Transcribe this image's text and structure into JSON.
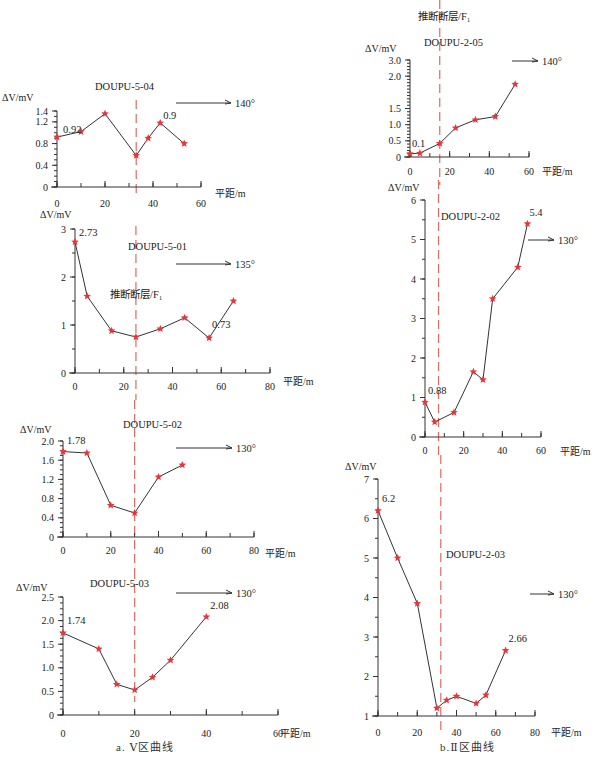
{
  "colors": {
    "axis": "#333333",
    "line": "#333333",
    "marker": "#e8343a",
    "fault": "#e06a5e"
  },
  "subcaptions": {
    "left": "a. Ⅴ区曲线",
    "right": "b.Ⅱ区曲线"
  },
  "chart_data": [
    {
      "id": "DOUPU-5-04",
      "type": "line",
      "title": "DOUPU-5-04",
      "xlabel": "平距/m",
      "ylabel": "ΔV/mV",
      "direction": "140°",
      "xlim": [
        0,
        60
      ],
      "ylim": [
        0,
        1.4
      ],
      "xticks": [
        0,
        20,
        40,
        60
      ],
      "yticks": [
        0,
        0.4,
        0.8,
        1.2,
        1.4
      ],
      "ytick_labels": [
        "0",
        "0.4",
        "0.8",
        "1.2",
        "1.4"
      ],
      "x": [
        0,
        10,
        20,
        33,
        38,
        43,
        53
      ],
      "values": [
        0.92,
        1.02,
        1.35,
        0.58,
        0.9,
        1.18,
        0.8
      ],
      "annotations": [
        {
          "text": "0.92",
          "x": 0,
          "y": 0.92
        },
        {
          "text": "0.9",
          "x": 43,
          "y": 1.18
        }
      ],
      "fault_x": 33
    },
    {
      "id": "DOUPU-5-01",
      "type": "line",
      "title": "DOUPU-5-01",
      "xlabel": "平距/m",
      "ylabel": "ΔV/mV",
      "direction": "135°",
      "fault_label": "推断断层/F₁",
      "xlim": [
        0,
        80
      ],
      "ylim": [
        0,
        3
      ],
      "xticks": [
        0,
        20,
        40,
        60,
        80
      ],
      "yticks": [
        0,
        1,
        2,
        3
      ],
      "ytick_labels": [
        "0",
        "1",
        "2",
        "3"
      ],
      "x": [
        0,
        5,
        15,
        25,
        35,
        45,
        55,
        65
      ],
      "values": [
        2.73,
        1.6,
        0.88,
        0.75,
        0.92,
        1.15,
        0.73,
        1.5
      ],
      "annotations": [
        {
          "text": "2.73",
          "x": 0,
          "y": 2.73
        },
        {
          "text": "0.73",
          "x": 55,
          "y": 0.73
        }
      ],
      "fault_x": 25
    },
    {
      "id": "DOUPU-5-02",
      "type": "line",
      "title": "DOUPU-5-02",
      "xlabel": "平距/m",
      "ylabel": "ΔV/mV",
      "direction": "130°",
      "xlim": [
        0,
        80
      ],
      "ylim": [
        0,
        2.0
      ],
      "xticks": [
        0,
        20,
        40,
        60,
        80
      ],
      "yticks": [
        0,
        0.4,
        0.8,
        1.2,
        1.6,
        2.0
      ],
      "ytick_labels": [
        "0",
        "0.4",
        "0.8",
        "1.2",
        "1.6",
        "2.0"
      ],
      "x": [
        0,
        10,
        20,
        30,
        40,
        50
      ],
      "values": [
        1.78,
        1.75,
        0.66,
        0.5,
        1.25,
        1.5
      ],
      "annotations": [
        {
          "text": "1.78",
          "x": 0,
          "y": 1.78
        }
      ],
      "fault_x": 30
    },
    {
      "id": "DOUPU-5-03",
      "type": "line",
      "title": "DOUPU-5-03",
      "xlabel": "平距/m",
      "ylabel": "ΔV/mV",
      "direction": "130°",
      "xlim": [
        0,
        60
      ],
      "ylim": [
        0,
        2.5
      ],
      "xticks": [
        0,
        20,
        40,
        60
      ],
      "yticks": [
        0,
        0.5,
        1.0,
        1.5,
        2.0,
        2.5
      ],
      "ytick_labels": [
        "0",
        "0.5",
        "1.0",
        "1.5",
        "2.0",
        "2.5"
      ],
      "x": [
        0,
        10,
        15,
        20,
        25,
        30,
        40
      ],
      "values": [
        1.74,
        1.4,
        0.65,
        0.53,
        0.8,
        1.16,
        2.08
      ],
      "annotations": [
        {
          "text": "1.74",
          "x": 0,
          "y": 1.74
        },
        {
          "text": "2.08",
          "x": 40,
          "y": 2.08
        }
      ],
      "fault_x": 20
    },
    {
      "id": "DOUPU-2-05",
      "type": "line",
      "title": "DOUPU-2-05",
      "xlabel": "平距/m",
      "ylabel": "ΔV/mV",
      "direction": "140°",
      "fault_label": "推断断层/F₁",
      "xlim": [
        0,
        60
      ],
      "ylim": [
        0,
        3.0
      ],
      "xticks": [
        0,
        20,
        40,
        60
      ],
      "yticks": [
        0,
        0.5,
        1.0,
        1.5,
        2.5,
        3.0
      ],
      "ytick_labels": [
        "0",
        "0.5",
        "1.0",
        "1.5",
        "2.0",
        "3.0"
      ],
      "x": [
        0,
        5,
        15,
        23,
        33,
        43,
        53
      ],
      "values": [
        0.1,
        0.12,
        0.42,
        0.9,
        1.15,
        1.25,
        2.25
      ],
      "annotations": [
        {
          "text": "0.1",
          "x": 0,
          "y": 0.1
        }
      ],
      "fault_x": 15
    },
    {
      "id": "DOUPU-2-02",
      "type": "line",
      "title": "DOUPU-2-02",
      "xlabel": "平距/m",
      "ylabel": "ΔV/mV",
      "direction": "130°",
      "xlim": [
        0,
        60
      ],
      "ylim": [
        0,
        6
      ],
      "xticks": [
        0,
        20,
        40,
        60
      ],
      "yticks": [
        0,
        1,
        2,
        3,
        4,
        5,
        6
      ],
      "ytick_labels": [
        "0",
        "1",
        "2",
        "3",
        "4",
        "5",
        "6"
      ],
      "x": [
        0,
        5,
        15,
        25,
        30,
        35,
        48,
        53
      ],
      "values": [
        0.88,
        0.38,
        0.62,
        1.65,
        1.45,
        3.5,
        4.3,
        5.4
      ],
      "annotations": [
        {
          "text": "0.88",
          "x": 0,
          "y": 0.88
        },
        {
          "text": "5.4",
          "x": 53,
          "y": 5.4
        }
      ],
      "fault_x": 7
    },
    {
      "id": "DOUPU-2-03",
      "type": "line",
      "title": "DOUPU-2-03",
      "xlabel": "平距/m",
      "ylabel": "ΔV/mV",
      "direction": "130°",
      "xlim": [
        0,
        80
      ],
      "ylim": [
        1,
        7
      ],
      "xticks": [
        0,
        20,
        40,
        60,
        80
      ],
      "yticks": [
        1,
        2,
        3,
        4,
        5,
        6,
        7
      ],
      "ytick_labels": [
        "1",
        "2",
        "3",
        "4",
        "5",
        "6",
        "7"
      ],
      "x": [
        0,
        10,
        20,
        30,
        35,
        40,
        50,
        55,
        65
      ],
      "values": [
        6.2,
        5.0,
        3.85,
        1.2,
        1.4,
        1.5,
        1.32,
        1.53,
        2.66
      ],
      "annotations": [
        {
          "text": "6.2",
          "x": 0,
          "y": 6.2
        },
        {
          "text": "2.66",
          "x": 65,
          "y": 2.66
        }
      ],
      "fault_x": 32
    }
  ]
}
